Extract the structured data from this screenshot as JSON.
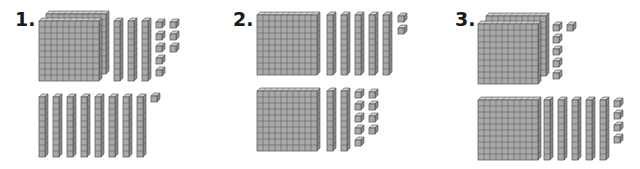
{
  "worksheet": {
    "colors": {
      "face": "#a9a9a9",
      "top": "#cfcfcf",
      "side": "#8a8a8a",
      "line": "#505050",
      "label": "#1a1a1a"
    },
    "cell_size": 6,
    "depth": 3,
    "problems": [
      {
        "label": "1.",
        "label_pos": [
          15,
          10
        ],
        "groups": [
          {
            "name": "top-addend",
            "flats": [
              {
                "x": 46,
                "y": 14
              },
              {
                "x": 39,
                "y": 21
              }
            ],
            "rods": [
              {
                "x": 114,
                "y": 21
              },
              {
                "x": 128,
                "y": 21
              },
              {
                "x": 142,
                "y": 21
              }
            ],
            "units": [
              {
                "x": 156,
                "y": 22
              },
              {
                "x": 156,
                "y": 34
              },
              {
                "x": 156,
                "y": 46
              },
              {
                "x": 156,
                "y": 58
              },
              {
                "x": 156,
                "y": 70
              },
              {
                "x": 170,
                "y": 22
              },
              {
                "x": 170,
                "y": 34
              },
              {
                "x": 170,
                "y": 46
              }
            ],
            "value": {
              "hundreds": 2,
              "tens": 3,
              "ones": 8
            }
          },
          {
            "name": "bottom-addend",
            "flats": [],
            "rods": [
              {
                "x": 39,
                "y": 97
              },
              {
                "x": 53,
                "y": 97
              },
              {
                "x": 67,
                "y": 97
              },
              {
                "x": 81,
                "y": 97
              },
              {
                "x": 95,
                "y": 97
              },
              {
                "x": 109,
                "y": 97
              },
              {
                "x": 123,
                "y": 97
              },
              {
                "x": 137,
                "y": 97
              }
            ],
            "units": [
              {
                "x": 151,
                "y": 96
              }
            ],
            "value": {
              "hundreds": 0,
              "tens": 8,
              "ones": 1
            }
          }
        ]
      },
      {
        "label": "2.",
        "label_pos": [
          233,
          10
        ],
        "groups": [
          {
            "name": "top-addend",
            "flats": [
              {
                "x": 257,
                "y": 15
              }
            ],
            "rods": [
              {
                "x": 327,
                "y": 15
              },
              {
                "x": 341,
                "y": 15
              },
              {
                "x": 355,
                "y": 15
              },
              {
                "x": 369,
                "y": 15
              },
              {
                "x": 383,
                "y": 15
              }
            ],
            "units": [
              {
                "x": 398,
                "y": 16
              },
              {
                "x": 398,
                "y": 28
              }
            ],
            "value": {
              "hundreds": 1,
              "tens": 5,
              "ones": 2
            }
          },
          {
            "name": "bottom-addend",
            "flats": [
              {
                "x": 257,
                "y": 91
              }
            ],
            "rods": [
              {
                "x": 327,
                "y": 91
              },
              {
                "x": 341,
                "y": 91
              }
            ],
            "units": [
              {
                "x": 355,
                "y": 92
              },
              {
                "x": 355,
                "y": 104
              },
              {
                "x": 355,
                "y": 116
              },
              {
                "x": 355,
                "y": 128
              },
              {
                "x": 355,
                "y": 140
              },
              {
                "x": 369,
                "y": 92
              },
              {
                "x": 369,
                "y": 104
              },
              {
                "x": 369,
                "y": 116
              },
              {
                "x": 369,
                "y": 128
              }
            ],
            "value": {
              "hundreds": 1,
              "tens": 2,
              "ones": 9
            }
          }
        ]
      },
      {
        "label": "3.",
        "label_pos": [
          455,
          10
        ],
        "groups": [
          {
            "name": "top-addend",
            "flats": [
              {
                "x": 486,
                "y": 16
              },
              {
                "x": 478,
                "y": 24
              }
            ],
            "rods": [],
            "units": [
              {
                "x": 553,
                "y": 25
              },
              {
                "x": 553,
                "y": 37
              },
              {
                "x": 553,
                "y": 49
              },
              {
                "x": 553,
                "y": 61
              },
              {
                "x": 553,
                "y": 73
              },
              {
                "x": 567,
                "y": 25
              }
            ],
            "value": {
              "hundreds": 2,
              "tens": 0,
              "ones": 6
            }
          },
          {
            "name": "bottom-addend",
            "flats": [
              {
                "x": 478,
                "y": 100
              }
            ],
            "rods": [
              {
                "x": 544,
                "y": 100
              },
              {
                "x": 558,
                "y": 100
              },
              {
                "x": 572,
                "y": 100
              },
              {
                "x": 586,
                "y": 100
              },
              {
                "x": 600,
                "y": 100
              }
            ],
            "units": [
              {
                "x": 614,
                "y": 101
              },
              {
                "x": 614,
                "y": 113
              },
              {
                "x": 614,
                "y": 125
              },
              {
                "x": 614,
                "y": 137
              }
            ],
            "value": {
              "hundreds": 1,
              "tens": 5,
              "ones": 4
            }
          }
        ]
      }
    ]
  }
}
